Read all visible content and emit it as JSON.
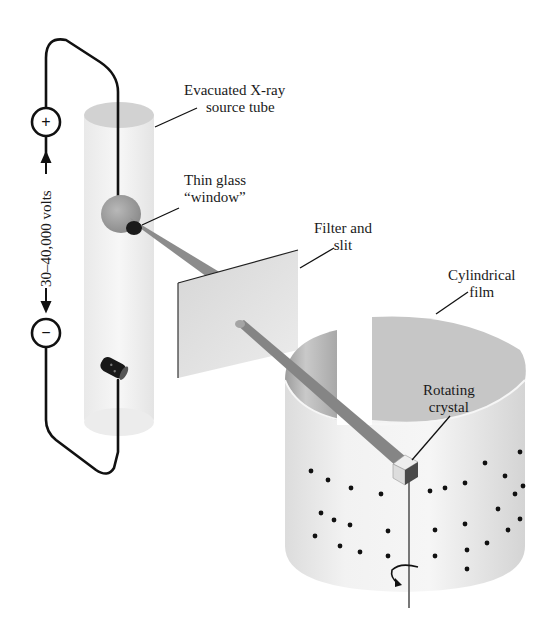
{
  "figure": {
    "type": "schematic illustration"
  },
  "labels": {
    "source_tube_line1": "Evacuated  X-ray",
    "source_tube_line2": "source tube",
    "window_line1": "Thin glass",
    "window_line2": "“window”",
    "filter_line1": "Filter and",
    "filter_line2": "slit",
    "film_line1": "Cylindrical",
    "film_line2": "film",
    "crystal_line1": "Rotating",
    "crystal_line2": "crystal",
    "voltage": "30–40,000 volts"
  },
  "terminals": {
    "positive": "+",
    "negative": "−"
  },
  "icons": {
    "rotation_arrow": "rotation-arrow-icon",
    "positive_terminal": "plus-circle-icon",
    "negative_terminal": "minus-circle-icon"
  },
  "colors": {
    "wire": "#111111",
    "tube_fill": "#f1f1f1",
    "beam": "#8a8a8a",
    "filter_plate": "#e2e2e2",
    "film": "#d9d9d9",
    "spots": "#111111"
  },
  "diffraction_spots_count": 34
}
